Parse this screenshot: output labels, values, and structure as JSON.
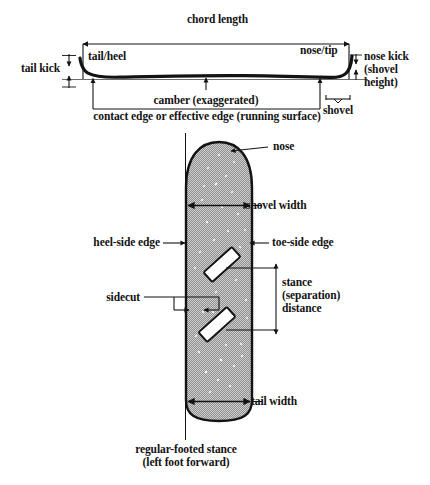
{
  "figure": {
    "title_profile": "side profile (camber view)",
    "title_plan": "top / base plan view",
    "colors": {
      "ink": "#131313",
      "board_fill": "#9a9a9a",
      "board_speckle": "#ffffff",
      "binding_fill": "#ffffff",
      "background": "#ffffff"
    }
  },
  "profile": {
    "labels": {
      "chord_length": "chord length",
      "tail_kick": "tail kick",
      "tail_heel": "tail/heel",
      "nose_tip": "nose/tip",
      "nose_kick": "nose kick\n(shovel\nheight)",
      "camber": "camber (exaggerated)",
      "shovel": "shovel",
      "contact_edge": "contact edge or effective edge (running surface)"
    }
  },
  "plan": {
    "labels": {
      "nose": "nose",
      "shovel_width": "shovel width",
      "heel_side_edge": "heel-side edge",
      "toe_side_edge": "toe-side edge",
      "sidecut": "sidecut",
      "stance_distance": "stance\n(separation)\ndistance",
      "tail_width": "tail width",
      "caption": "regular-footed stance\n(left foot forward)"
    }
  }
}
